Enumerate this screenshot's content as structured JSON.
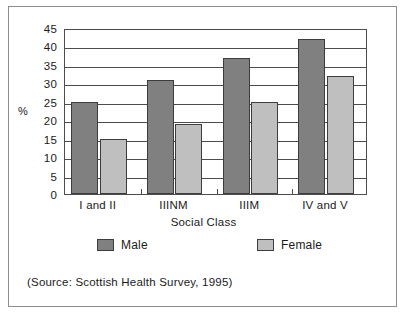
{
  "figure": {
    "source_note": "(Source: Scottish Health Survey, 1995)",
    "border_color": "#8c8c8c"
  },
  "legend": {
    "position": "below-axis",
    "entries": [
      {
        "label": "Male",
        "color": "#808080"
      },
      {
        "label": "Female",
        "color": "#bfbfbf"
      }
    ]
  },
  "chart_data": {
    "type": "bar",
    "title": "",
    "subtitle": "",
    "xlabel": "Social Class",
    "ylabel": "%",
    "categories": [
      "I and II",
      "IIINM",
      "IIIM",
      "IV and V"
    ],
    "series": [
      {
        "name": "Male",
        "color": "#808080",
        "values": [
          25,
          31,
          37,
          42
        ]
      },
      {
        "name": "Female",
        "color": "#bfbfbf",
        "values": [
          15,
          19,
          25,
          32
        ]
      }
    ],
    "ylim": [
      0,
      45
    ],
    "ytick_step": 5,
    "yticks": [
      0,
      5,
      10,
      15,
      20,
      25,
      30,
      35,
      40,
      45
    ],
    "ytick_labels": [
      "0",
      "5",
      "10",
      "15",
      "20",
      "25",
      "30",
      "35",
      "40",
      "45"
    ],
    "grid": "horizontal",
    "legend_position": "bottom",
    "annotations": [
      "(Source: Scottish Health Survey, 1995)"
    ]
  }
}
